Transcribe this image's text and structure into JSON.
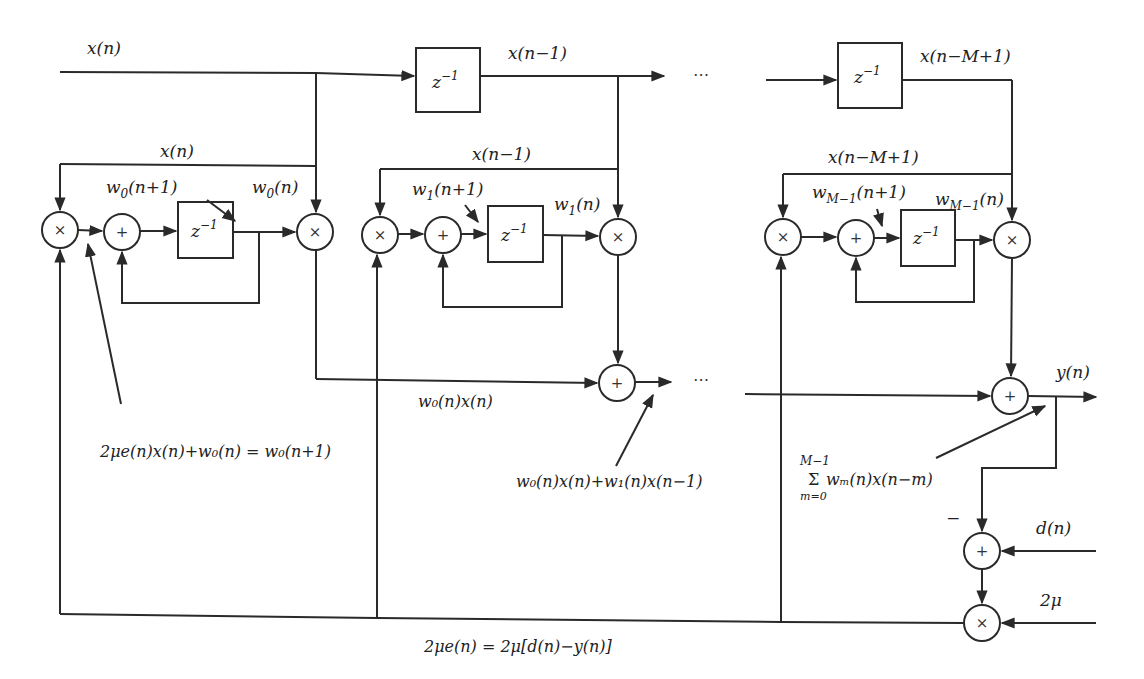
{
  "diagram": {
    "input_signal": "x(n)",
    "delay_symbol": {
      "base": "z",
      "exponent": "−1"
    },
    "multiply_symbol": "×",
    "add_symbol": "+",
    "ellipsis": "⋯",
    "minus_sign": "−",
    "top_labels": {
      "x_n": "x(n)",
      "x_n_minus_1": "x(n−1)",
      "x_n_minus_M_plus_1": "x(n−M+1)"
    },
    "stages": [
      {
        "tap_input": "x(n)",
        "weight_next": {
          "base": "w",
          "sub": "0",
          "arg": "(n+1)"
        },
        "weight_now": {
          "base": "w",
          "sub": "0",
          "arg": "(n)"
        }
      },
      {
        "tap_input": "x(n−1)",
        "weight_next": {
          "base": "w",
          "sub": "1",
          "arg": "(n+1)"
        },
        "weight_now": {
          "base": "w",
          "sub": "1",
          "arg": "(n)"
        }
      },
      {
        "tap_input": "x(n−M+1)",
        "weight_next": {
          "base": "w",
          "sub": "M−1",
          "arg": "(n+1)"
        },
        "weight_now": {
          "base": "w",
          "sub": "M−1",
          "arg": "(n)"
        }
      }
    ],
    "annotations": {
      "weight_update": "2μe(n)x(n)+w₀(n) = w₀(n+1)",
      "first_product": "w₀(n)x(n)",
      "partial_sum": "w₀(n)x(n)+w₁(n)x(n−1)",
      "sum_upper": "M−1",
      "sum_symbol": "Σ",
      "sum_body": "wₘ(n)x(n−m)",
      "sum_lower": "m=0",
      "error_feedback": "2μe(n) = 2μ[d(n)−y(n)]"
    },
    "output_signal": "y(n)",
    "desired_signal": "d(n)",
    "step_size": "2μ"
  }
}
